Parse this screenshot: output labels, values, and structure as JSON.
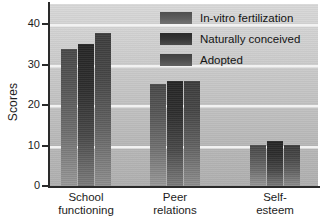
{
  "chart_data": {
    "type": "bar",
    "title": "",
    "xlabel": "",
    "ylabel": "Scores",
    "ylim": [
      0,
      45
    ],
    "yticks": [
      0,
      10,
      20,
      30,
      40
    ],
    "grid": true,
    "legend_position": "top-right",
    "categories": [
      "School functioning",
      "Peer relations",
      "Self-esteem"
    ],
    "category_lines": [
      [
        "School",
        "functioning"
      ],
      [
        "Peer",
        "relations"
      ],
      [
        "Self-",
        "esteem"
      ]
    ],
    "series": [
      {
        "name": "In-vitro fertilization",
        "values": [
          34.2,
          25.4,
          10.4
        ],
        "color": "#5d5d5d"
      },
      {
        "name": "Naturally conceived",
        "values": [
          35.4,
          26.2,
          11.3
        ],
        "color": "#353535"
      },
      {
        "name": "Adopted",
        "values": [
          38.0,
          26.1,
          10.4
        ],
        "color": "#4d4d4d"
      }
    ]
  },
  "axis": {
    "y_title": "Scores",
    "tick_labels": [
      "0",
      "10",
      "20",
      "30",
      "40"
    ]
  },
  "legend": {
    "entries": [
      {
        "label": "In-vitro fertilization"
      },
      {
        "label": "Naturally conceived"
      },
      {
        "label": "Adopted"
      }
    ]
  },
  "colors": {
    "plot_background_top": "#d9d9d9",
    "plot_background_bottom": "#b0b0b0",
    "gridline": "#f2f2f2",
    "axis": "#2a2a2a",
    "text": "#1c1c1c"
  }
}
